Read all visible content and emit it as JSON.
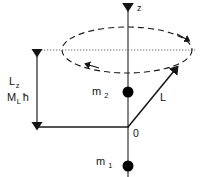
{
  "figure": {
    "background_color": "#ffffff",
    "line_color": "#141414",
    "axis_color": "#4a4a4a",
    "dot_color": "#000000",
    "width": 201,
    "height": 177
  },
  "labels": {
    "axis_z": "z",
    "origin": "0",
    "vector_L": "L",
    "projection_symbol": "L",
    "projection_subscript": "z",
    "quantum_number": "M",
    "quantum_subscript": "L",
    "hbar": "ħ",
    "mass_2": "m",
    "mass_2_sub": "2",
    "mass_1": "m",
    "mass_1_sub": "1"
  },
  "geometry": {
    "z_axis_x": 128,
    "z_axis_top_y": 2,
    "z_axis_bottom_y": 177,
    "origin_x": 128,
    "origin_y": 127,
    "ellipse_cx": 127,
    "ellipse_cy": 50,
    "ellipse_rx": 65,
    "ellipse_ry": 23,
    "dotted_line_y": 50,
    "dotted_line_x1": 37,
    "dotted_line_x2": 196,
    "measure_bar_x": 37,
    "measure_top_y": 48,
    "measure_bottom_y": 127,
    "baseline_y": 127,
    "baseline_x1": 37,
    "baseline_x2": 128,
    "vector_tip_x": 176,
    "vector_tip_y": 69,
    "dot_m2_x": 128,
    "dot_m2_y": 92,
    "dot_m1_x": 128,
    "dot_m1_y": 166,
    "dot_radius": 5.5
  },
  "annotations": {
    "precession_arrow_right_desc": "clockwise-precession-arrow-right",
    "precession_arrow_left_desc": "clockwise-precession-arrow-left"
  }
}
